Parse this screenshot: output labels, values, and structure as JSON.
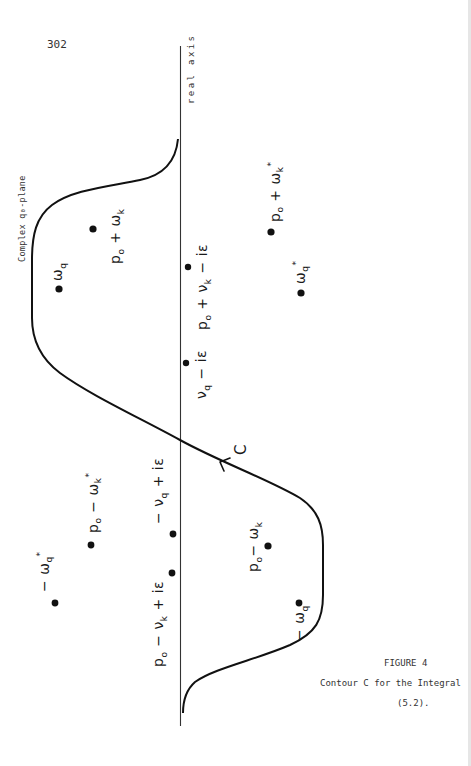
{
  "page": {
    "number": "302"
  },
  "figure": {
    "axis_label": "real axis",
    "plane_label": "Complex q₀-plane",
    "contour_label": "C",
    "points": [
      {
        "id": "omega_q",
        "label": "ωq",
        "x": 59,
        "y": 289
      },
      {
        "id": "p0_plus_omega_k",
        "label": "p₀ + ωk",
        "x": 93,
        "y": 229
      },
      {
        "id": "p0_plus_nu_k_minus_ie",
        "label": "p₀ + νk − iε",
        "x": 188,
        "y": 267
      },
      {
        "id": "nu_q_minus_ie",
        "label": "νq − iε",
        "x": 186,
        "y": 363
      },
      {
        "id": "p0_plus_omega_k_star",
        "label": "p₀ + ωk*",
        "x": 271,
        "y": 232
      },
      {
        "id": "omega_q_star",
        "label": "ωq*",
        "x": 301,
        "y": 293
      },
      {
        "id": "minus_nu_q_plus_ie",
        "label": "−νq + iε",
        "x": 173,
        "y": 534
      },
      {
        "id": "p0_minus_nu_k_plus_ie",
        "label": "p₀ − νk + iε",
        "x": 172,
        "y": 573
      },
      {
        "id": "p0_minus_omega_k_star",
        "label": "p₀ − ωk*",
        "x": 91,
        "y": 545
      },
      {
        "id": "minus_omega_q_star",
        "label": "−ωq*",
        "x": 55,
        "y": 603
      },
      {
        "id": "p0_minus_omega_k",
        "label": "p₀ − ωk",
        "x": 268,
        "y": 546
      },
      {
        "id": "minus_omega_q",
        "label": "−ωq",
        "x": 299,
        "y": 603
      }
    ]
  },
  "caption": {
    "title": "FIGURE 4",
    "line1": "Contour C for the Integral",
    "line2": "(5.2)."
  }
}
